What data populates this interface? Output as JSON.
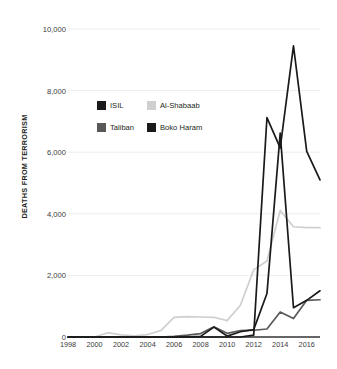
{
  "chart_data": {
    "type": "line",
    "title": "",
    "subtitle": "",
    "xlabel": "",
    "ylabel": "DEATHS FROM TERRORISM",
    "xlim": [
      1998,
      2017
    ],
    "ylim": [
      0,
      10000
    ],
    "grid": true,
    "grid_axis": "y",
    "legend_position": "inside-upper-left",
    "x": [
      1998,
      1999,
      2000,
      2001,
      2002,
      2003,
      2004,
      2005,
      2006,
      2007,
      2008,
      2009,
      2010,
      2011,
      2012,
      2013,
      2014,
      2015,
      2016,
      2017
    ],
    "x_tick_labels": [
      "1998",
      "2000",
      "2002",
      "2004",
      "2006",
      "2008",
      "2010",
      "2012",
      "2014",
      "2016"
    ],
    "x_tick_values": [
      1998,
      2000,
      2002,
      2004,
      2006,
      2008,
      2010,
      2012,
      2014,
      2016
    ],
    "y_tick_labels": [
      "0",
      "2,000",
      "4,000",
      "6,000",
      "8,000",
      "10,000"
    ],
    "y_tick_values": [
      0,
      2000,
      4000,
      6000,
      8000,
      10000
    ],
    "series": [
      {
        "name": "ISIL",
        "color": "#1a1a1a",
        "values": [
          0,
          0,
          0,
          0,
          0,
          0,
          0,
          0,
          0,
          0,
          0,
          0,
          0,
          0,
          60,
          7120,
          6140,
          9450,
          6030,
          5100
        ]
      },
      {
        "name": "Al-Shabaab",
        "color": "#cfcfcf",
        "values": [
          0,
          0,
          0,
          140,
          70,
          40,
          80,
          210,
          640,
          660,
          650,
          640,
          530,
          1030,
          2180,
          2470,
          4110,
          3580,
          3550,
          3550
        ]
      },
      {
        "name": "Taliban",
        "color": "#585858",
        "values": [
          0,
          0,
          0,
          0,
          0,
          0,
          0,
          0,
          20,
          60,
          110,
          330,
          120,
          210,
          220,
          260,
          810,
          600,
          1190,
          1210
        ]
      },
      {
        "name": "Boko Haram",
        "color": "#1a1a1a",
        "values": [
          0,
          0,
          0,
          0,
          0,
          0,
          0,
          0,
          0,
          0,
          20,
          320,
          30,
          170,
          240,
          1410,
          6620,
          950,
          1190,
          1500
        ]
      }
    ]
  },
  "axis": {
    "y_title": "DEATHS FROM TERRORISM",
    "y_ticks": [
      "10,000",
      "8,000",
      "6,000",
      "4,000",
      "2,000",
      "0"
    ],
    "x_ticks": [
      "1998",
      "2000",
      "2002",
      "2004",
      "2006",
      "2008",
      "2010",
      "2012",
      "2014",
      "2016"
    ]
  },
  "legend": {
    "rows": [
      {
        "left": {
          "label": "ISIL",
          "color": "#1a1a1a"
        },
        "right": {
          "label": "Al-Shabaab",
          "color": "#cfcfcf"
        }
      },
      {
        "left": {
          "label": "Taliban",
          "color": "#585858"
        },
        "right": {
          "label": "Boko Haram",
          "color": "#1a1a1a"
        }
      }
    ]
  },
  "colors": {
    "isil": "#1a1a1a",
    "al_shabaab": "#cfcfcf",
    "taliban": "#585858",
    "boko_haram": "#1a1a1a",
    "grid": "#ededed",
    "text": "#231f20",
    "background": "#ffffff"
  }
}
